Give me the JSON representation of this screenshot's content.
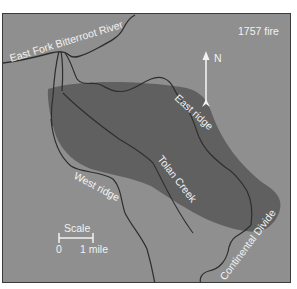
{
  "map": {
    "title": "1757 fire",
    "labels": {
      "river": "East Fork Bitterroot River",
      "east_ridge": "East ridge",
      "west_ridge": "West ridge",
      "creek": "Tolan Creek",
      "divide": "Continental Divide"
    },
    "north_arrow": {
      "label": "N",
      "icon": "north-arrow-icon"
    },
    "scale": {
      "title": "Scale",
      "start": "0",
      "end": "1 mile"
    },
    "colors": {
      "background": "#8f8f8f",
      "burn_area": "#5c5c5c",
      "lines": "#2e2e2e",
      "text": "#f2f2f2",
      "frame": "#3a3a3a"
    }
  }
}
